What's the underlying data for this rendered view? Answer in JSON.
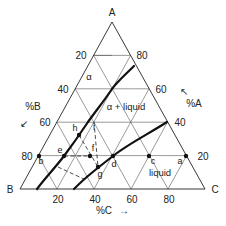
{
  "diagram": {
    "type": "ternary-phase-diagram",
    "vertices": {
      "top": "A",
      "bottom_left": "B",
      "bottom_right": "C"
    },
    "axis_labels": {
      "left": "%B",
      "right": "%A",
      "bottom": "%C"
    },
    "axis_arrows": {
      "left": "↙",
      "right": "↖",
      "bottom": "→"
    },
    "left_ticks": [
      "20",
      "40",
      "60",
      "80"
    ],
    "right_ticks": [
      "80",
      "60",
      "40",
      "20"
    ],
    "bottom_ticks": [
      "20",
      "40",
      "60",
      "80"
    ],
    "regions": {
      "alpha": "α",
      "alpha_liquid": "α + liquid",
      "liquid": "liquid"
    },
    "points": {
      "a": "a",
      "b": "b",
      "c": "c",
      "d": "d",
      "e": "e",
      "f": "f",
      "g": "g",
      "h": "h",
      "i": "i"
    },
    "colors": {
      "line": "#111111",
      "grid": "#555555",
      "background": "#ffffff"
    }
  }
}
